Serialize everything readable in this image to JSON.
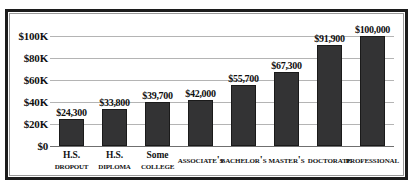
{
  "chart_data": {
    "type": "bar",
    "title": "",
    "subtitle": "",
    "xlabel": "",
    "ylabel": "",
    "categories": [
      "H.S. Dropout",
      "H.S. Diploma",
      "Some College",
      "Associate's",
      "Bachelor's",
      "Master's",
      "Doctorate",
      "Professional"
    ],
    "category_lines": [
      [
        "H.S.",
        "Dropout"
      ],
      [
        "H.S.",
        "Diploma"
      ],
      [
        "Some",
        "College"
      ],
      [
        "Associate's"
      ],
      [
        "Bachelor's"
      ],
      [
        "Master's"
      ],
      [
        "Doctorate"
      ],
      [
        "Professional"
      ]
    ],
    "values": [
      24300,
      33800,
      39700,
      42000,
      55700,
      67300,
      91900,
      100000
    ],
    "data_labels": [
      "$24,300",
      "$33,800",
      "$39,700",
      "$42,000",
      "$55,700",
      "$67,300",
      "$91,900",
      "$100,000"
    ],
    "ylim": [
      0,
      110000
    ],
    "yticks": [
      0,
      20000,
      40000,
      60000,
      80000,
      100000
    ],
    "ytick_labels": [
      "$0",
      "$20K",
      "$40K",
      "$60K",
      "$80K",
      "$100K"
    ],
    "grid": "horizontal",
    "legend": "none",
    "bar_color": "#333334",
    "grid_color": "#b4b4b4",
    "axis_color": "#6f6f6f",
    "background_color": "#ffffff",
    "border_color": "#1c1c1c"
  }
}
